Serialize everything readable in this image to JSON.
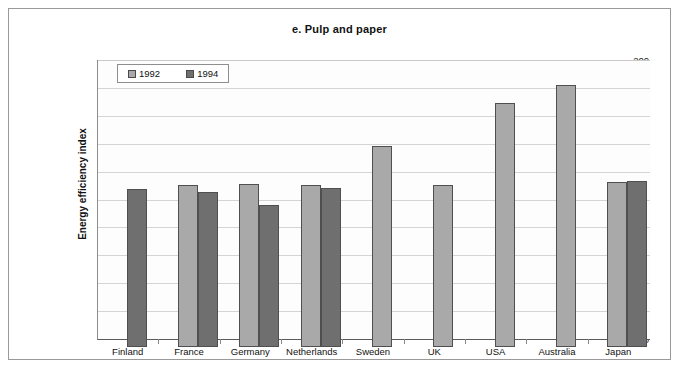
{
  "chart_data": {
    "type": "bar",
    "title": "e. Pulp and paper",
    "xlabel": "",
    "ylabel": "Energy efficiency index",
    "ylim": [
      0,
      200
    ],
    "ytick_step": 20,
    "yticks": [
      200,
      180,
      160,
      140,
      120,
      100,
      80,
      60,
      40,
      20,
      0
    ],
    "grid": true,
    "legend_position": "top-left inside plot",
    "categories": [
      "Finland",
      "France",
      "Germany",
      "Netherlands",
      "Sweden",
      "UK",
      "USA",
      "Australia",
      "Japan"
    ],
    "series": [
      {
        "name": "1992",
        "color": "#a9a9a9",
        "values": [
          null,
          116,
          117,
          116,
          144,
          116,
          175,
          188,
          118
        ]
      },
      {
        "name": "1994",
        "color": "#6f6f6f",
        "values": [
          113,
          111,
          102,
          114,
          null,
          null,
          null,
          null,
          119
        ]
      }
    ]
  },
  "colors": {
    "series_1992": "#a9a9a9",
    "series_1994": "#6f6f6f",
    "frame_border": "#9a9a9a",
    "gridline": "#d4d4d4",
    "axis": "#5a5a5a",
    "text": "#111111"
  }
}
